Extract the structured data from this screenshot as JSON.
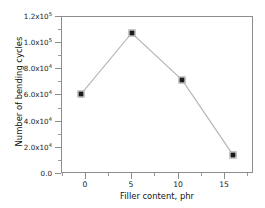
{
  "chart_data": {
    "type": "line",
    "title": "",
    "xlabel": "Filler content, phr",
    "ylabel": "Number of bending cycles",
    "x": [
      0,
      5,
      10,
      15
    ],
    "values": [
      60500,
      107000,
      71000,
      14000
    ],
    "series": [
      {
        "name": "Number of bending cycles",
        "values": [
          60500,
          107000,
          71000,
          14000
        ]
      }
    ],
    "xlim": [
      -2,
      17
    ],
    "ylim": [
      0,
      120000
    ],
    "xticks": [
      0,
      5,
      10,
      15
    ],
    "xticklabels": [
      "0",
      "5",
      "10",
      "15"
    ],
    "yticks": [
      0,
      20000,
      40000,
      60000,
      80000,
      100000,
      120000
    ],
    "yticklabels": [
      {
        "mantissa": "0.0",
        "exponent": ""
      },
      {
        "mantissa": "2.0x10",
        "exponent": "4"
      },
      {
        "mantissa": "4.0x10",
        "exponent": "4"
      },
      {
        "mantissa": "6.0x10",
        "exponent": "4"
      },
      {
        "mantissa": "8.0x10",
        "exponent": "4"
      },
      {
        "mantissa": "1.0x10",
        "exponent": "5"
      },
      {
        "mantissa": "1.2x10",
        "exponent": "5"
      }
    ],
    "grid": false,
    "legend": null,
    "marker": "square",
    "marker_color": "#1c1c1c",
    "line_color": "#b3b3b3",
    "frame_color": "#8d8d8d",
    "background": "#ffffff"
  }
}
